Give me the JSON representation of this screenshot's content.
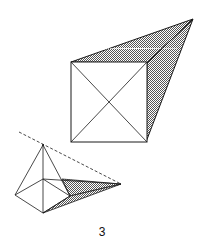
{
  "figure": {
    "label": "3",
    "colors": {
      "stroke": "#1a1a1a",
      "shade": "#8a8a8a",
      "background": "#ffffff"
    }
  },
  "large_shape": {
    "description": "square with diagonals and shaded projection to a vanishing apex",
    "square": {
      "tl": [
        71,
        62
      ],
      "tr": [
        147,
        63
      ],
      "br": [
        146,
        142
      ],
      "bl": [
        71,
        142
      ]
    },
    "apex": [
      193,
      19
    ]
  },
  "small_shape": {
    "description": "pyramid with shaded projection to far point and dashed sight line",
    "apex": [
      43,
      145
    ],
    "base_center": [
      43,
      179
    ],
    "base_left": [
      15,
      195
    ],
    "base_bottom": [
      43,
      213
    ],
    "base_right": [
      70,
      196
    ],
    "far_point": [
      121,
      184
    ],
    "dashed_start": [
      19,
      132
    ]
  }
}
